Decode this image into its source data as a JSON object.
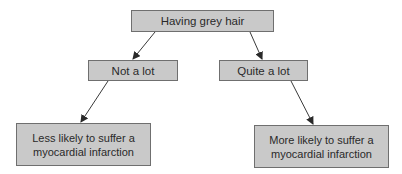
{
  "diagram": {
    "type": "tree",
    "colors": {
      "node_fill": "#c9c9c9",
      "node_border": "#6f6f6f",
      "text": "#2a2a2a",
      "edge": "#3a3a3a",
      "background": "#ffffff"
    },
    "nodes": {
      "root": {
        "label": "Having grey hair"
      },
      "left": {
        "label": "Not a lot"
      },
      "right": {
        "label": "Quite a lot"
      },
      "bottom_left": {
        "line1": "Less likely to suffer a",
        "line2": "myocardial infarction"
      },
      "bottom_right": {
        "line1": "More likely to suffer a",
        "line2": "myocardial infarction"
      }
    },
    "edges": [
      {
        "from": "root",
        "to": "left"
      },
      {
        "from": "root",
        "to": "right"
      },
      {
        "from": "left",
        "to": "bottom_left"
      },
      {
        "from": "right",
        "to": "bottom_right"
      }
    ]
  }
}
